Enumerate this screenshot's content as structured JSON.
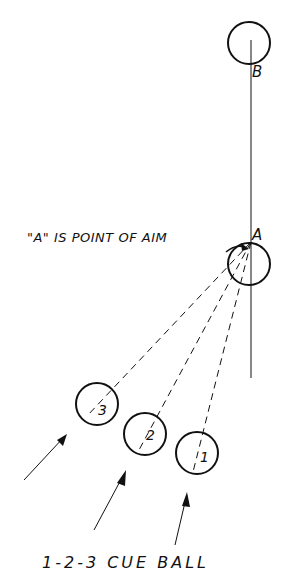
{
  "diagram": {
    "object_balls": [
      {
        "id": "B",
        "label": "B",
        "cx": 249,
        "cy": 43,
        "r": 21
      },
      {
        "id": "A",
        "label": "A",
        "cx": 249,
        "cy": 264,
        "r": 21
      }
    ],
    "aim_label": "\"A\" IS POINT OF AIM",
    "cue_balls": [
      {
        "id": "3",
        "label": "3",
        "cx": 97,
        "cy": 404,
        "r": 21
      },
      {
        "id": "2",
        "label": "2",
        "cx": 145,
        "cy": 434,
        "r": 21
      },
      {
        "id": "1",
        "label": "1",
        "cx": 197,
        "cy": 453,
        "r": 21
      }
    ],
    "caption": "1-2-3 CUE BALL",
    "colors": {
      "ink": "#111111",
      "background": "#ffffff"
    }
  }
}
